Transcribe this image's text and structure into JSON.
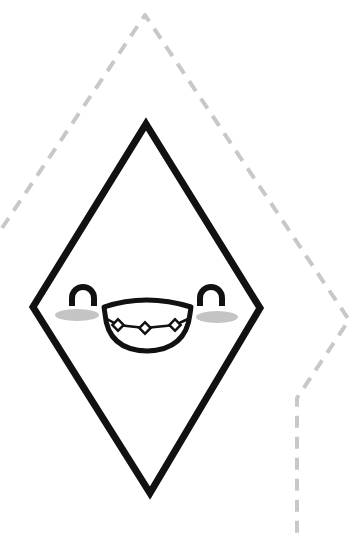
{
  "illustration": {
    "subject": "kawaii diamond gem with braces",
    "colors": {
      "background": "#ffffff",
      "outline": "#111111",
      "dashed_path": "#c8c8c8",
      "cheeks": "#c4c4c4"
    },
    "diamond": {
      "top": [
        146,
        122
      ],
      "right": [
        262,
        308
      ],
      "bottom": [
        150,
        496
      ],
      "left": [
        31,
        307
      ],
      "stroke_width": 7
    },
    "dashed_path": {
      "points": [
        [
          2,
          228
        ],
        [
          145,
          15
        ],
        [
          349,
          320
        ],
        [
          297,
          398
        ],
        [
          297,
          535
        ]
      ],
      "stroke_width": 4,
      "dash": "12 9"
    },
    "face": {
      "left_eye": "happy-closed-eye-arch",
      "right_eye": "happy-closed-eye-arch",
      "mouth": "open-smile-with-braces",
      "braces_studs": 3
    }
  }
}
